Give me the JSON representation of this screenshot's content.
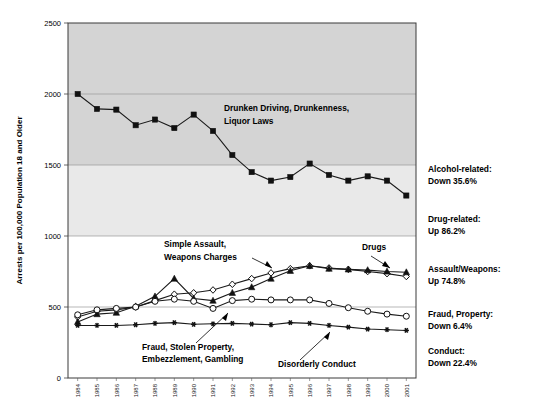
{
  "chart_data": {
    "type": "line",
    "title": "",
    "xlabel": "",
    "ylabel": "Arrests per 100,000 Population 18 and Older",
    "ylim": [
      0,
      2500
    ],
    "yticks": [
      0,
      500,
      1000,
      1500,
      2000,
      2500
    ],
    "grid": true,
    "legend_position": "inline-annotations",
    "categories": [
      "1984",
      "1985",
      "1986",
      "1987",
      "1988",
      "1989",
      "1990",
      "1991",
      "1992",
      "1993",
      "1994",
      "1995",
      "1996",
      "1997",
      "1998",
      "1999",
      "2000",
      "2001"
    ],
    "series": [
      {
        "name": "Drunken Driving, Drunkenness, Liquor Laws",
        "marker": "filled-square",
        "values": [
          2000,
          1895,
          1890,
          1780,
          1820,
          1760,
          1855,
          1740,
          1570,
          1450,
          1390,
          1415,
          1510,
          1430,
          1390,
          1420,
          1390,
          1285
        ]
      },
      {
        "name": "Simple Assault, Weapons Charges",
        "marker": "open-diamond",
        "values": [
          430,
          470,
          480,
          500,
          545,
          590,
          600,
          620,
          660,
          700,
          740,
          770,
          790,
          775,
          765,
          750,
          735,
          715
        ]
      },
      {
        "name": "Drugs",
        "marker": "filled-triangle",
        "values": [
          395,
          450,
          460,
          505,
          575,
          700,
          560,
          545,
          600,
          640,
          700,
          755,
          790,
          770,
          765,
          760,
          750,
          745
        ]
      },
      {
        "name": "Fraud, Stolen Property, Embezzlement, Gambling",
        "marker": "open-circle",
        "values": [
          445,
          480,
          490,
          500,
          540,
          555,
          540,
          490,
          545,
          555,
          550,
          550,
          550,
          525,
          495,
          470,
          450,
          435
        ]
      },
      {
        "name": "Disorderly Conduct",
        "marker": "star",
        "values": [
          370,
          370,
          370,
          375,
          385,
          390,
          378,
          382,
          385,
          380,
          375,
          390,
          385,
          370,
          358,
          345,
          340,
          335
        ]
      }
    ],
    "inline_annotations": [
      {
        "id": "alcohol",
        "text_lines": [
          "Drunken Driving, Drunkenness,",
          "Liquor Laws"
        ]
      },
      {
        "id": "assault",
        "text_lines": [
          "Simple Assault,",
          "Weapons Charges"
        ]
      },
      {
        "id": "drugs",
        "text_lines": [
          "Drugs"
        ]
      },
      {
        "id": "fraud",
        "text_lines": [
          "Fraud, Stolen Property,",
          "Embezzlement, Gambling"
        ]
      },
      {
        "id": "conduct",
        "text_lines": [
          "Disorderly Conduct"
        ]
      }
    ],
    "side_annotations": [
      {
        "id": "alcohol-related",
        "line1": "Alcohol-related:",
        "line2": "Down 35.6%"
      },
      {
        "id": "drug-related",
        "line1": "Drug-related:",
        "line2": "Up 86.2%"
      },
      {
        "id": "assault-weapons",
        "line1": "Assault/Weapons:",
        "line2": "Up 74.8%"
      },
      {
        "id": "fraud-property",
        "line1": "Fraud, Property:",
        "line2": "Down 6.4%"
      },
      {
        "id": "conduct-change",
        "line1": "Conduct:",
        "line2": "Down 22.4%"
      }
    ],
    "colors": {
      "series_line": "#1a1a1a",
      "gridline": "#9a9a9a",
      "band_upper": "#d4d4d4",
      "band_mid": "#e9e9e9",
      "band_lower": "#ffffff"
    }
  }
}
